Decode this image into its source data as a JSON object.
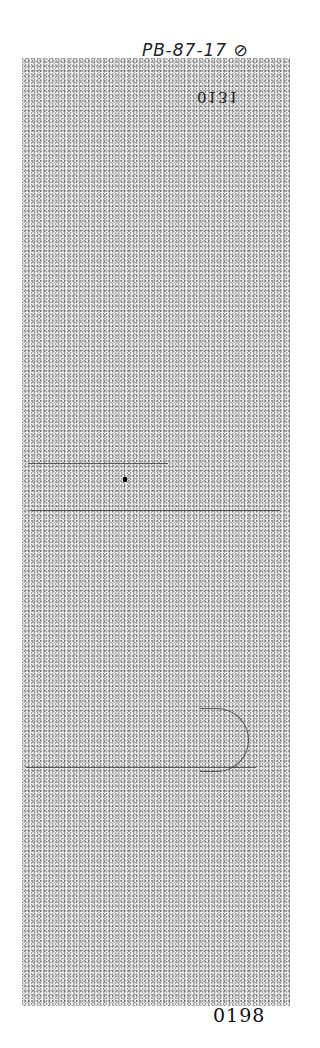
{
  "document": {
    "handwritten_annotation": "PB-87-17 ⊘",
    "stamp_number": "0131",
    "page_number": "0198",
    "ruled_lines": [
      {
        "top": 463,
        "left": 28,
        "width": 140
      },
      {
        "top": 510,
        "left": 30,
        "width": 250
      },
      {
        "top": 767,
        "left": 26,
        "width": 230
      }
    ]
  }
}
